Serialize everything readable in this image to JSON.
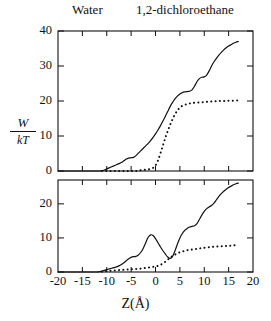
{
  "figure": {
    "legend": {
      "water_label": "Water",
      "dce_label": "1,2-dichloroethane"
    },
    "y_axis_label": {
      "numerator": "W",
      "denominator": "kT"
    },
    "x_axis_label": "Z(Å)"
  },
  "chart_data": [
    {
      "type": "line",
      "panel": "top",
      "title": "",
      "xlabel": "",
      "ylabel": "W/kT",
      "xlim": [
        -20,
        20
      ],
      "ylim": [
        0,
        40
      ],
      "xticks": [
        -20,
        -15,
        -10,
        -5,
        0,
        5,
        10,
        15,
        20
      ],
      "yticks": [
        0,
        10,
        20,
        30,
        40
      ],
      "ytick_labels": [
        "0",
        "10",
        "20",
        "30",
        "40"
      ],
      "grid": false,
      "legend_position": "above-figure",
      "series": [
        {
          "name": "Water",
          "style": "solid",
          "color": "#111111",
          "x": [
            -20,
            -16,
            -13,
            -11.5,
            -11,
            -10.5,
            -10,
            -9.5,
            -9,
            -8.5,
            -8,
            -7.5,
            -7,
            -6.5,
            -6,
            -5.5,
            -5,
            -4.5,
            -4,
            -3.5,
            -3,
            -2.5,
            -2,
            -1.5,
            -1,
            -0.5,
            0,
            0.5,
            1,
            1.5,
            2,
            2.5,
            3,
            3.5,
            4,
            4.5,
            5,
            5.5,
            6,
            6.5,
            7,
            7.5,
            8,
            8.5,
            9,
            9.5,
            10,
            10.5,
            11,
            11.5,
            12,
            12.5,
            13,
            13.5,
            14,
            14.5,
            15,
            15.5,
            16,
            16.5,
            17
          ],
          "y": [
            0,
            0,
            0,
            0,
            0.1,
            0.3,
            0.6,
            0.9,
            1.2,
            1.5,
            1.8,
            2.1,
            2.4,
            2.9,
            3.4,
            3.7,
            3.8,
            3.9,
            4.4,
            5.1,
            5.8,
            6.5,
            7.2,
            7.9,
            8.7,
            9.6,
            10.6,
            11.7,
            12.9,
            14.2,
            15.6,
            17.0,
            18.4,
            19.6,
            20.6,
            21.4,
            22.0,
            22.4,
            22.6,
            22.7,
            22.8,
            23.2,
            24.2,
            25.5,
            26.4,
            26.8,
            26.9,
            27.4,
            28.6,
            30.0,
            31.2,
            32.2,
            33.1,
            33.9,
            34.6,
            35.2,
            35.7,
            36.1,
            36.5,
            36.8,
            37.0
          ]
        },
        {
          "name": "1,2-dichloroethane",
          "style": "dotted",
          "color": "#111111",
          "x": [
            -11,
            -10.5,
            -10,
            -9.5,
            -9,
            -8.5,
            -8,
            -7.5,
            -7,
            -6.5,
            -6,
            -5.5,
            -5,
            -4.5,
            -4,
            -3.5,
            -3,
            -2.5,
            -2,
            -1.5,
            -1,
            -0.5,
            0,
            0.5,
            1,
            1.5,
            2,
            2.5,
            3,
            3.5,
            4,
            4.5,
            5,
            5.5,
            6,
            6.5,
            7,
            7.5,
            8,
            9,
            10,
            11,
            12,
            13,
            14,
            15,
            16,
            17
          ],
          "y": [
            0,
            0,
            0,
            0,
            0,
            0,
            0,
            0,
            0,
            0,
            0,
            0,
            0,
            0,
            0,
            0.1,
            0.2,
            0.3,
            0.4,
            0.5,
            0.6,
            0.9,
            1.6,
            3.0,
            5.0,
            7.2,
            9.4,
            11.4,
            13.2,
            14.8,
            16.2,
            17.3,
            18.1,
            18.6,
            18.9,
            19.1,
            19.3,
            19.4,
            19.5,
            19.6,
            19.7,
            19.8,
            19.9,
            20.0,
            20.0,
            20.1,
            20.1,
            20.2
          ]
        }
      ]
    },
    {
      "type": "line",
      "panel": "bottom",
      "title": "",
      "xlabel": "Z(Å)",
      "ylabel": "W/kT",
      "xlim": [
        -20,
        20
      ],
      "ylim": [
        0,
        27
      ],
      "xticks": [
        -20,
        -15,
        -10,
        -5,
        0,
        5,
        10,
        15,
        20
      ],
      "xtick_labels": [
        "-20",
        "-15",
        "-10",
        "-5",
        "0",
        "5",
        "10",
        "15",
        "20"
      ],
      "yticks": [
        0,
        10,
        20
      ],
      "ytick_labels": [
        "0",
        "10",
        "20"
      ],
      "grid": false,
      "legend_position": "above-figure",
      "series": [
        {
          "name": "Water",
          "style": "solid",
          "color": "#111111",
          "x": [
            -20,
            -15,
            -12,
            -11.5,
            -11,
            -10.5,
            -10,
            -9.5,
            -9,
            -8.5,
            -8,
            -7.5,
            -7,
            -6.5,
            -6,
            -5.5,
            -5,
            -4.5,
            -4,
            -3.5,
            -3,
            -2.5,
            -2,
            -1.5,
            -1,
            -0.5,
            0,
            0.5,
            1,
            1.5,
            2,
            2.5,
            3,
            3.5,
            4,
            4.5,
            5,
            5.5,
            6,
            6.5,
            7,
            7.5,
            8,
            8.5,
            9,
            9.5,
            10,
            10.5,
            11,
            11.5,
            12,
            12.5,
            13,
            13.5,
            14,
            14.5,
            15,
            15.5,
            16,
            16.5,
            17
          ],
          "y": [
            0,
            0,
            0,
            0.1,
            0.3,
            0.5,
            0.7,
            0.9,
            1.1,
            1.3,
            1.5,
            1.8,
            2.2,
            2.7,
            3.3,
            3.9,
            4.3,
            4.5,
            4.6,
            5.0,
            5.8,
            7.0,
            8.6,
            10.2,
            10.9,
            10.7,
            9.8,
            8.6,
            7.4,
            6.3,
            5.3,
            4.4,
            4.0,
            4.6,
            6.2,
            8.2,
            10.0,
            11.3,
            12.2,
            12.8,
            13.2,
            13.4,
            13.6,
            14.2,
            15.4,
            16.7,
            17.8,
            18.6,
            19.1,
            19.5,
            20.2,
            21.2,
            22.2,
            23.0,
            23.7,
            24.3,
            24.8,
            25.2,
            25.6,
            25.9,
            26.1
          ]
        },
        {
          "name": "1,2-dichloroethane",
          "style": "dotted",
          "color": "#111111",
          "x": [
            -11,
            -10.5,
            -10,
            -9.5,
            -9,
            -8.5,
            -8,
            -7.5,
            -7,
            -6.5,
            -6,
            -5.5,
            -5,
            -4.5,
            -4,
            -3.5,
            -3,
            -2.5,
            -2,
            -1.5,
            -1,
            -0.5,
            0,
            0.5,
            1,
            1.5,
            2,
            2.5,
            3,
            3.5,
            4,
            4.5,
            5,
            5.5,
            6,
            6.5,
            7,
            7.5,
            8,
            8.5,
            9,
            9.5,
            10,
            11,
            12,
            13,
            14,
            15,
            16,
            17
          ],
          "y": [
            0.1,
            0.2,
            0.3,
            0.35,
            0.4,
            0.45,
            0.5,
            0.55,
            0.6,
            0.65,
            0.7,
            0.75,
            0.8,
            0.85,
            0.9,
            0.95,
            1.0,
            1.1,
            1.2,
            1.3,
            1.4,
            1.5,
            1.6,
            1.8,
            2.1,
            2.5,
            3.0,
            3.6,
            4.2,
            4.7,
            5.1,
            5.5,
            5.8,
            6.0,
            6.2,
            6.4,
            6.5,
            6.6,
            6.7,
            6.8,
            6.9,
            7.0,
            7.1,
            7.3,
            7.4,
            7.5,
            7.6,
            7.7,
            7.8,
            7.9
          ]
        }
      ]
    }
  ],
  "ticks": {
    "top_y_labels": [
      "40",
      "30",
      "20",
      "10",
      "0"
    ],
    "bottom_y_labels": [
      "20",
      "10",
      "0"
    ],
    "x_labels": [
      "-20",
      "-15",
      "-10",
      "-5",
      "0",
      "5",
      "10",
      "15",
      "20"
    ]
  }
}
